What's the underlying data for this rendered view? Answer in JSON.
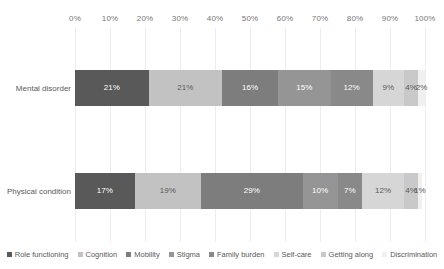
{
  "chart_data": {
    "type": "bar",
    "orientation": "horizontal",
    "stacked": true,
    "normalized_percent": true,
    "title": "",
    "subtitle": "",
    "xlabel": "",
    "ylabel": "",
    "xlim": [
      0,
      100
    ],
    "grid": true,
    "axis_position": "top",
    "legend_position": "bottom",
    "categories": [
      "Mental disorder",
      "Physical condition"
    ],
    "tick_labels": [
      "0%",
      "10%",
      "20%",
      "30%",
      "40%",
      "50%",
      "60%",
      "70%",
      "80%",
      "90%",
      "100%"
    ],
    "tick_values": [
      0,
      10,
      20,
      30,
      40,
      50,
      60,
      70,
      80,
      90,
      100
    ],
    "series": [
      {
        "name": "Role functioning",
        "color": "#595959",
        "label_color": "#ffffff",
        "values": [
          21,
          17
        ],
        "value_labels": [
          "21%",
          "17%"
        ]
      },
      {
        "name": "Cognition",
        "color": "#c2c2c2",
        "label_color": "#5a5a5a",
        "values": [
          21,
          19
        ],
        "value_labels": [
          "21%",
          "19%"
        ]
      },
      {
        "name": "Mobility",
        "color": "#7d7d7d",
        "label_color": "#ffffff",
        "values": [
          16,
          29
        ],
        "value_labels": [
          "16%",
          "29%"
        ]
      },
      {
        "name": "Stigma",
        "color": "#959595",
        "label_color": "#ffffff",
        "values": [
          15,
          10
        ],
        "value_labels": [
          "15%",
          "10%"
        ]
      },
      {
        "name": "Family burden",
        "color": "#898989",
        "label_color": "#ffffff",
        "values": [
          12,
          7
        ],
        "value_labels": [
          "12%",
          "7%"
        ]
      },
      {
        "name": "Self-care",
        "color": "#d6d6d6",
        "label_color": "#5a5a5a",
        "values": [
          9,
          12
        ],
        "value_labels": [
          "9%",
          "12%"
        ]
      },
      {
        "name": "Getting along",
        "color": "#c9c9c9",
        "label_color": "#5a5a5a",
        "values": [
          4,
          4
        ],
        "value_labels": [
          "4%",
          "4%"
        ]
      },
      {
        "name": "Discrimination",
        "color": "#f0f0f0",
        "label_color": "#5a5a5a",
        "values": [
          2,
          1
        ],
        "value_labels": [
          "2%",
          "1%"
        ]
      }
    ]
  },
  "colors": {
    "background": "#ffffff",
    "gridline": "#ededed",
    "tick_text": "#767676",
    "category_text": "#5a5a5a",
    "legend_text": "#5a5a5a"
  }
}
